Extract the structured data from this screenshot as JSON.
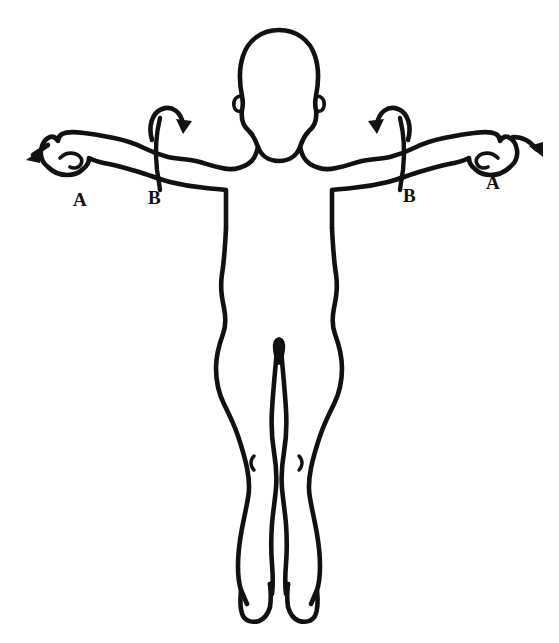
{
  "diagram": {
    "background_color": "#ffffff",
    "ink_color": "#111111",
    "view": "anterior",
    "figure_name": "human-body-outline",
    "labels": [
      {
        "id": "left-a",
        "text": "A",
        "side": "left",
        "refers_to": "hand-arrow-outward"
      },
      {
        "id": "left-b",
        "text": "B",
        "side": "left",
        "refers_to": "forearm-rotation-arrow"
      },
      {
        "id": "right-b",
        "text": "B",
        "side": "right",
        "refers_to": "forearm-rotation-arrow"
      },
      {
        "id": "right-a",
        "text": "A",
        "side": "right",
        "refers_to": "hand-arrow-outward"
      }
    ],
    "annotations": {
      "left_hand_arrow": "arrow-pointing-down-left",
      "right_hand_arrow": "arrow-pointing-down-right",
      "left_forearm_arrow": "curved-rotation-arrow-clockwise",
      "right_forearm_arrow": "curved-rotation-arrow-counterclockwise",
      "left_forearm_marker": "vertical-marker-line",
      "right_forearm_marker": "vertical-marker-line"
    },
    "parts": [
      "head",
      "ears",
      "neck",
      "shoulders",
      "left-arm",
      "right-arm",
      "left-fist",
      "right-fist",
      "torso",
      "waist",
      "hips",
      "left-leg",
      "right-leg",
      "left-knee-mark",
      "right-knee-mark",
      "left-foot",
      "right-foot"
    ]
  }
}
